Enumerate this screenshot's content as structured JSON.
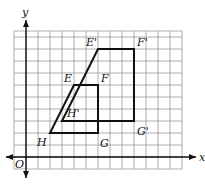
{
  "diagram": {
    "type": "coordinate-grid-dilation",
    "axes": {
      "x_label": "x",
      "y_label": "y",
      "origin_label": "O"
    },
    "grid": {
      "x_min": -1,
      "x_max": 13,
      "y_min": -1,
      "y_max": 10.5,
      "unit_px": 12,
      "origin_px": [
        26,
        157
      ]
    },
    "original": {
      "name": "EFGH",
      "vertices": [
        {
          "label": "E",
          "x": 4,
          "y": 6
        },
        {
          "label": "F",
          "x": 6,
          "y": 6
        },
        {
          "label": "G",
          "x": 6,
          "y": 2
        },
        {
          "label": "H",
          "x": 2,
          "y": 2
        }
      ]
    },
    "image": {
      "name": "E'F'G'H'",
      "vertices": [
        {
          "label": "E'",
          "x": 6,
          "y": 9
        },
        {
          "label": "F'",
          "x": 9,
          "y": 9
        },
        {
          "label": "G'",
          "x": 9,
          "y": 3
        },
        {
          "label": "H'",
          "x": 3,
          "y": 3
        }
      ]
    },
    "colors": {
      "grid": "#9a9a9a",
      "axis": "#111111",
      "figure": "#111111"
    }
  }
}
